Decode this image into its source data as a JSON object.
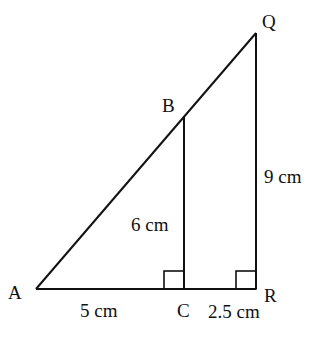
{
  "diagram": {
    "points": {
      "A": {
        "label": "A"
      },
      "B": {
        "label": "B"
      },
      "C": {
        "label": "C"
      },
      "Q": {
        "label": "Q"
      },
      "R": {
        "label": "R"
      }
    },
    "measurements": {
      "AC": "5 cm",
      "CR": "2.5 cm",
      "BC": "6 cm",
      "QR": "9 cm"
    },
    "right_angles": [
      "C",
      "R"
    ],
    "colors": {
      "stroke": "#111111",
      "background": "#ffffff"
    }
  }
}
